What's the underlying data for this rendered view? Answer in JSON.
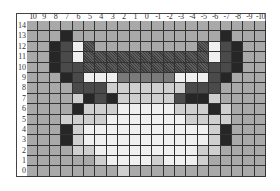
{
  "columns": [
    "10",
    "9",
    "8",
    "7",
    "6",
    "5",
    "4",
    "3",
    "2",
    "1",
    "0",
    "-1",
    "-2",
    "-3",
    "-4",
    "-5",
    "-6",
    "-7",
    "-8",
    "-9",
    "-10"
  ],
  "rows": [
    "14",
    "13",
    "12",
    "11",
    "10",
    "9",
    "8",
    "7",
    "6",
    "5",
    "4",
    "3",
    "2",
    "1",
    "0"
  ],
  "palette": {
    "G": "#a9a9a9",
    "K": "#262626",
    "D": "#4a4a4a",
    "X": "#505050",
    "W": "#f0f0f0",
    "L": "#cfcfcf",
    "M": "#7a7a7a"
  },
  "cells": [
    "GGGGGGGGGGGGGGGGGGGGG",
    "GGGKGGGGGGGGGGGGGKGGG",
    "GGKDWXGGGGGGGGGXWDKGG",
    "GGKDWXXXXXXXXXXXWDKGG",
    "GGKDDXXXXXXXXXXXDDKGG",
    "GGGKDWWWMMMMMWWWDKGGG",
    "GGGGDDDLLLLLLLDDDGGGG",
    "GGGGLKDKLLLLLDKKLGGGG",
    "GGGGKLLLWWWWWLLLKLGGG",
    "GGGLLLLWWWWWWWLLLLGGG",
    "GGGKLWWWWWWWWWWWLKGGG",
    "GGGKLWWWWWWWWWWWLKGGG",
    "GGGGLLWWWWWWWWWLLGGGG",
    "GGGGGGLWWWWLWWWLGGGGG",
    "GGGGGGGGLGGGGGGGGGGGG"
  ]
}
